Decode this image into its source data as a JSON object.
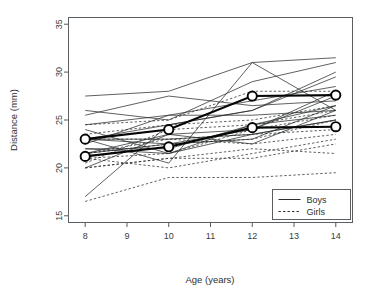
{
  "chart_data": {
    "type": "line",
    "title": "",
    "xlabel": "Age (years)",
    "ylabel": "Distance (mm)",
    "x": [
      8,
      10,
      12,
      14
    ],
    "xlim": [
      7.6,
      14.4
    ],
    "ylim": [
      14.3,
      35.7
    ],
    "xticks": [
      8,
      9,
      10,
      11,
      12,
      13,
      14
    ],
    "xticklabels": [
      "8",
      "9",
      "10",
      "11",
      "12",
      "13",
      "14"
    ],
    "yticks": [
      15,
      20,
      25,
      30,
      35
    ],
    "yticklabels": [
      "15",
      "20",
      "25",
      "30",
      "35"
    ],
    "grid": false,
    "legend": {
      "position": "bottom-right",
      "entries": [
        {
          "label": "Boys",
          "style": "solid"
        },
        {
          "label": "Girls",
          "style": "dashed"
        }
      ]
    },
    "series": [
      {
        "name": "M01",
        "group": "Boys",
        "style": "solid",
        "values": [
          26.0,
          25.0,
          29.0,
          31.0
        ]
      },
      {
        "name": "M02",
        "group": "Boys",
        "style": "solid",
        "values": [
          21.5,
          22.5,
          23.0,
          26.5
        ]
      },
      {
        "name": "M03",
        "group": "Boys",
        "style": "solid",
        "values": [
          23.0,
          22.5,
          24.0,
          27.5
        ]
      },
      {
        "name": "M04",
        "group": "Boys",
        "style": "solid",
        "values": [
          25.5,
          27.5,
          26.5,
          27.0
        ]
      },
      {
        "name": "M05",
        "group": "Boys",
        "style": "solid",
        "values": [
          20.0,
          23.5,
          22.5,
          26.0
        ]
      },
      {
        "name": "M06",
        "group": "Boys",
        "style": "solid",
        "values": [
          24.5,
          25.5,
          27.0,
          28.5
        ]
      },
      {
        "name": "M07",
        "group": "Boys",
        "style": "solid",
        "values": [
          22.0,
          22.0,
          24.5,
          26.5
        ]
      },
      {
        "name": "M08",
        "group": "Boys",
        "style": "solid",
        "values": [
          24.0,
          21.5,
          24.5,
          25.5
        ]
      },
      {
        "name": "M09",
        "group": "Boys",
        "style": "solid",
        "values": [
          23.0,
          20.5,
          31.0,
          26.0
        ]
      },
      {
        "name": "M10",
        "group": "Boys",
        "style": "solid",
        "values": [
          27.5,
          28.0,
          31.0,
          31.5
        ]
      },
      {
        "name": "M11",
        "group": "Boys",
        "style": "solid",
        "values": [
          23.0,
          23.0,
          23.5,
          25.0
        ]
      },
      {
        "name": "M12",
        "group": "Boys",
        "style": "solid",
        "values": [
          21.5,
          23.5,
          24.0,
          28.0
        ]
      },
      {
        "name": "M13",
        "group": "Boys",
        "style": "solid",
        "values": [
          17.0,
          24.5,
          26.0,
          29.5
        ]
      },
      {
        "name": "M14",
        "group": "Boys",
        "style": "solid",
        "values": [
          22.5,
          25.5,
          25.5,
          26.0
        ]
      },
      {
        "name": "M15",
        "group": "Boys",
        "style": "solid",
        "values": [
          23.0,
          24.5,
          26.0,
          30.0
        ]
      },
      {
        "name": "M16",
        "group": "Boys",
        "style": "solid",
        "values": [
          22.0,
          21.5,
          23.5,
          25.0
        ]
      },
      {
        "name": "F01",
        "group": "Girls",
        "style": "dashed",
        "values": [
          21.0,
          20.0,
          21.5,
          23.0
        ]
      },
      {
        "name": "F02",
        "group": "Girls",
        "style": "dashed",
        "values": [
          21.0,
          21.5,
          24.0,
          25.5
        ]
      },
      {
        "name": "F03",
        "group": "Girls",
        "style": "dashed",
        "values": [
          20.5,
          24.0,
          24.5,
          26.0
        ]
      },
      {
        "name": "F04",
        "group": "Girls",
        "style": "dashed",
        "values": [
          23.5,
          24.5,
          25.0,
          26.5
        ]
      },
      {
        "name": "F05",
        "group": "Girls",
        "style": "dashed",
        "values": [
          21.5,
          23.0,
          22.5,
          23.5
        ]
      },
      {
        "name": "F06",
        "group": "Girls",
        "style": "dashed",
        "values": [
          20.0,
          21.0,
          21.0,
          22.5
        ]
      },
      {
        "name": "F07",
        "group": "Girls",
        "style": "dashed",
        "values": [
          21.5,
          22.5,
          23.0,
          25.0
        ]
      },
      {
        "name": "F08",
        "group": "Girls",
        "style": "dashed",
        "values": [
          23.0,
          23.0,
          23.5,
          24.0
        ]
      },
      {
        "name": "F09",
        "group": "Girls",
        "style": "dashed",
        "values": [
          20.0,
          21.0,
          22.0,
          21.5
        ]
      },
      {
        "name": "F10",
        "group": "Girls",
        "style": "dashed",
        "values": [
          16.5,
          19.0,
          19.0,
          19.5
        ]
      },
      {
        "name": "F11",
        "group": "Girls",
        "style": "dashed",
        "values": [
          24.5,
          25.0,
          28.0,
          28.0
        ]
      }
    ],
    "highlighted": [
      {
        "name": "highlight-upper",
        "style": "solid-thick-circles",
        "values": [
          23.0,
          24.0,
          27.5,
          27.6
        ]
      },
      {
        "name": "highlight-lower",
        "style": "solid-thick-circles",
        "values": [
          21.2,
          22.2,
          24.2,
          24.3
        ]
      }
    ]
  }
}
